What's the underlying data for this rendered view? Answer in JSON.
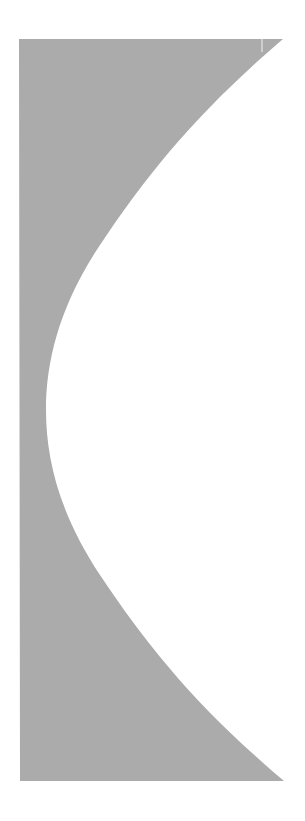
{
  "figure": {
    "fill_color": "#ababab",
    "background_color": "#ffffff",
    "divider_color": "#f2f2f2",
    "shape": {
      "top_left": [
        19,
        39
      ],
      "top_right": [
        283,
        39
      ],
      "bottom_right": [
        284,
        781
      ],
      "bottom_left": [
        20,
        781
      ],
      "curve_leftmost": [
        46,
        410
      ]
    }
  }
}
